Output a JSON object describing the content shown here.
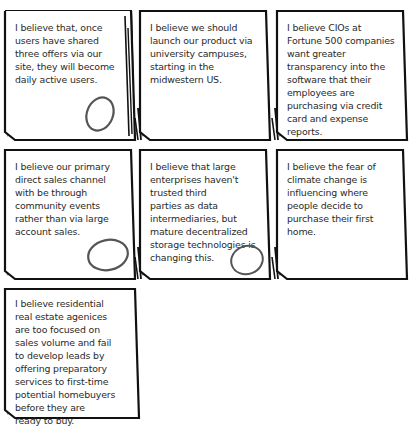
{
  "cards": [
    {
      "text": "I believe that, once\nusers have shared\nthree offers via our\nsite, they will become\ndaily active users.",
      "circled": true
    },
    {
      "text": "I believe we should\nlaunch our product via\nuniversity campuses,\nstarting in the\nmidwestern US.",
      "circled": false
    },
    {
      "text": "I believe CIOs at\nFortune 500 companies\nwant greater\ntransparency into the\nsoftware that their\nemployees are\npurchasing via credit\ncard and expense\nreports.",
      "circled": false
    },
    {
      "text": "I believe our primary\ndirect sales channel\nwith be through\ncommunity events\nrather than via large\naccount sales.",
      "circled": true
    },
    {
      "text": "I believe that large\nenterprises haven't\ntrusted third\nparties as data\nintermediaries, but\nmature decentralized\nstorage technologies is\nchanging this.",
      "circled": true
    },
    {
      "text": "I believe the fear of\nclimate change is\ninfluencing where\npeople decide to\npurchase their first\nhome.",
      "circled": false
    },
    {
      "text": "I believe residential\nreal estate agenices\nare too focused on\nsales volume and fail\nto develop leads by\noffering preparatory\nservices to first-time\npotential homebuyers\nbefore they are\nready to buy.",
      "circled": false
    }
  ]
}
